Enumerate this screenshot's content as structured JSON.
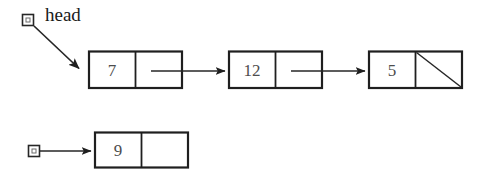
{
  "diagram": {
    "kind": "linked-list-diagram",
    "background_color": "#ffffff",
    "line_color": "#262626",
    "box_border_color": "#1f1f1f",
    "value_text_color": "#4d4d4d",
    "label_text_color": "#1a1a1a",
    "pointer_labels": [
      {
        "id": "head",
        "text": "head"
      }
    ],
    "lists": [
      {
        "id": "top-list",
        "handle": {
          "id": "head-handle",
          "label": "head",
          "shape": "small-square"
        },
        "nodes": [
          {
            "id": "node-7",
            "value": "7",
            "next": "arrow"
          },
          {
            "id": "node-12",
            "value": "12",
            "next": "arrow"
          },
          {
            "id": "node-5",
            "value": "5",
            "next": "null-slash"
          }
        ]
      },
      {
        "id": "bottom-list",
        "handle": {
          "id": "unlabeled-handle",
          "label": "",
          "shape": "small-square"
        },
        "nodes": [
          {
            "id": "node-9",
            "value": "9",
            "next": "empty"
          }
        ]
      }
    ]
  }
}
